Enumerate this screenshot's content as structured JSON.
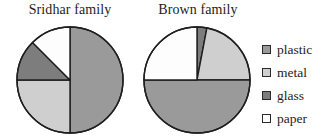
{
  "legend": {
    "position": "right",
    "items": [
      {
        "label": "plastic",
        "color": "#9a9a9a",
        "key": "plastic"
      },
      {
        "label": "metal",
        "color": "#cfcfcf",
        "key": "metal"
      },
      {
        "label": "glass",
        "color": "#7d7d7d",
        "key": "glass"
      },
      {
        "label": "paper",
        "color": "#fdfdfd",
        "key": "paper"
      }
    ]
  },
  "chart_data": [
    {
      "type": "pie",
      "title": "Sridhar family",
      "labels": [
        "plastic",
        "metal",
        "glass",
        "paper"
      ],
      "values": [
        50,
        25,
        12.5,
        12.5
      ],
      "colors": [
        "#9a9a9a",
        "#cfcfcf",
        "#7d7d7d",
        "#fdfdfd"
      ],
      "start_angle": 0,
      "direction": "clockwise",
      "center": [
        70,
        80
      ],
      "radius": 53,
      "grid": false
    },
    {
      "type": "pie",
      "title": "Brown family",
      "labels": [
        "glass",
        "metal",
        "plastic",
        "paper"
      ],
      "values": [
        3,
        22,
        50,
        25
      ],
      "colors": [
        "#7d7d7d",
        "#cfcfcf",
        "#9a9a9a",
        "#fdfdfd"
      ],
      "start_angle": 0,
      "direction": "clockwise",
      "center": [
        197,
        80
      ],
      "radius": 53,
      "grid": false
    }
  ],
  "style": {
    "stroke": "#1f1f1f",
    "stroke_width": 1.4,
    "background": "#ffffff"
  }
}
